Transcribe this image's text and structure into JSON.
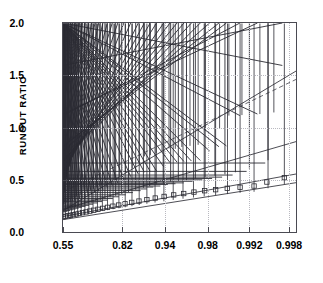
{
  "chart_data": {
    "type": "scatter",
    "title": "",
    "xlabel": "",
    "ylabel": "RUNOUT RATIO",
    "grid": true,
    "legend": "none",
    "ylim": [
      0.0,
      2.0
    ],
    "yticks": [
      "0.0",
      "0.5",
      "1.0",
      "1.5",
      "2.0"
    ],
    "ytick_values": [
      0.0,
      0.5,
      1.0,
      1.5,
      2.0
    ],
    "xticks": [
      "0.55",
      "0.82",
      "0.94",
      "0.98",
      "0.992",
      "0.998"
    ],
    "xtick_values": [
      0.55,
      0.82,
      0.94,
      0.98,
      0.992,
      0.998
    ],
    "xtick_positions": [
      0.0,
      0.2553,
      0.438,
      0.621,
      0.8,
      0.9702
    ],
    "xlim_positions": [
      0.0,
      1.0
    ],
    "axis_note": "x axis uses a non-linear probability scale",
    "series": [
      {
        "name": "diamond-series",
        "marker": "diamond",
        "color": "#2b2b33",
        "points": [
          [
            0.0,
            0.255
          ],
          [
            0.006,
            0.262
          ],
          [
            0.012,
            0.268
          ],
          [
            0.018,
            0.275
          ],
          [
            0.024,
            0.281
          ],
          [
            0.03,
            0.289
          ],
          [
            0.037,
            0.296
          ],
          [
            0.044,
            0.303
          ],
          [
            0.051,
            0.311
          ],
          [
            0.058,
            0.318
          ],
          [
            0.066,
            0.326
          ],
          [
            0.074,
            0.334
          ],
          [
            0.082,
            0.342
          ],
          [
            0.091,
            0.351
          ],
          [
            0.1,
            0.36
          ],
          [
            0.11,
            0.369
          ],
          [
            0.12,
            0.379
          ],
          [
            0.131,
            0.39
          ],
          [
            0.143,
            0.402
          ],
          [
            0.156,
            0.415
          ],
          [
            0.17,
            0.43
          ],
          [
            0.185,
            0.446
          ],
          [
            0.202,
            0.465
          ],
          [
            0.221,
            0.487
          ],
          [
            0.243,
            0.513
          ],
          [
            0.268,
            0.545
          ],
          [
            0.297,
            0.585
          ],
          [
            0.327,
            0.64
          ],
          [
            0.35,
            0.7
          ],
          [
            0.375,
            0.712
          ],
          [
            0.4,
            0.73
          ],
          [
            0.425,
            0.745
          ],
          [
            0.455,
            0.775
          ],
          [
            0.482,
            0.772
          ],
          [
            0.51,
            0.79
          ],
          [
            0.545,
            0.8
          ],
          [
            0.58,
            0.81
          ],
          [
            0.61,
            0.945
          ],
          [
            0.672,
            0.965
          ],
          [
            0.712,
            1.09
          ],
          [
            0.768,
            1.095
          ],
          [
            0.845,
            1.105
          ],
          [
            0.905,
            1.12
          ]
        ]
      },
      {
        "name": "cross-series",
        "marker": "cross",
        "color": "#2b2b33",
        "points": [
          [
            0.0,
            0.232
          ],
          [
            0.008,
            0.238
          ],
          [
            0.016,
            0.244
          ],
          [
            0.024,
            0.25
          ],
          [
            0.033,
            0.257
          ],
          [
            0.042,
            0.264
          ],
          [
            0.051,
            0.271
          ],
          [
            0.061,
            0.278
          ],
          [
            0.071,
            0.286
          ],
          [
            0.082,
            0.294
          ],
          [
            0.094,
            0.303
          ],
          [
            0.106,
            0.313
          ],
          [
            0.119,
            0.324
          ],
          [
            0.133,
            0.336
          ],
          [
            0.148,
            0.349
          ],
          [
            0.164,
            0.363
          ],
          [
            0.182,
            0.38
          ],
          [
            0.201,
            0.399
          ],
          [
            0.222,
            0.42
          ],
          [
            0.246,
            0.445
          ],
          [
            0.272,
            0.474
          ],
          [
            0.301,
            0.507
          ],
          [
            0.334,
            0.53
          ],
          [
            0.36,
            0.548
          ],
          [
            0.385,
            0.556
          ],
          [
            0.412,
            0.56
          ],
          [
            0.443,
            0.6
          ],
          [
            0.47,
            0.64
          ],
          [
            0.5,
            0.645
          ],
          [
            0.53,
            0.65
          ],
          [
            0.562,
            0.655
          ],
          [
            0.6,
            0.66
          ],
          [
            0.64,
            0.752
          ],
          [
            0.68,
            0.792
          ],
          [
            0.712,
            0.8
          ],
          [
            0.77,
            1.09
          ],
          [
            0.845,
            1.105
          ],
          [
            0.952,
            1.57
          ]
        ]
      },
      {
        "name": "plus-series",
        "marker": "plus",
        "color": "#2b2b33",
        "points": [
          [
            0.0,
            0.18
          ],
          [
            0.01,
            0.186
          ],
          [
            0.02,
            0.192
          ],
          [
            0.031,
            0.198
          ],
          [
            0.042,
            0.205
          ],
          [
            0.054,
            0.212
          ],
          [
            0.066,
            0.219
          ],
          [
            0.079,
            0.227
          ],
          [
            0.093,
            0.236
          ],
          [
            0.108,
            0.245
          ],
          [
            0.124,
            0.255
          ],
          [
            0.141,
            0.266
          ],
          [
            0.16,
            0.278
          ],
          [
            0.18,
            0.291
          ],
          [
            0.202,
            0.305
          ],
          [
            0.226,
            0.32
          ],
          [
            0.252,
            0.337
          ],
          [
            0.281,
            0.356
          ],
          [
            0.312,
            0.377
          ],
          [
            0.345,
            0.396
          ],
          [
            0.372,
            0.412
          ],
          [
            0.4,
            0.43
          ],
          [
            0.43,
            0.44
          ],
          [
            0.462,
            0.455
          ],
          [
            0.495,
            0.462
          ],
          [
            0.53,
            0.47
          ],
          [
            0.568,
            0.485
          ],
          [
            0.61,
            0.5
          ],
          [
            0.652,
            0.512
          ],
          [
            0.695,
            0.525
          ],
          [
            0.74,
            0.545
          ],
          [
            0.8,
            0.58
          ],
          [
            0.88,
            0.66
          ]
        ]
      },
      {
        "name": "square-series",
        "marker": "square",
        "color": "#2b2b33",
        "points": [
          [
            0.0,
            0.145
          ],
          [
            0.01,
            0.15
          ],
          [
            0.021,
            0.155
          ],
          [
            0.032,
            0.16
          ],
          [
            0.044,
            0.166
          ],
          [
            0.057,
            0.172
          ],
          [
            0.07,
            0.178
          ],
          [
            0.084,
            0.185
          ],
          [
            0.099,
            0.192
          ],
          [
            0.115,
            0.2
          ],
          [
            0.132,
            0.208
          ],
          [
            0.15,
            0.217
          ],
          [
            0.17,
            0.226
          ],
          [
            0.191,
            0.236
          ],
          [
            0.214,
            0.247
          ],
          [
            0.239,
            0.258
          ],
          [
            0.266,
            0.27
          ],
          [
            0.295,
            0.283
          ],
          [
            0.326,
            0.296
          ],
          [
            0.36,
            0.31
          ],
          [
            0.396,
            0.325
          ],
          [
            0.434,
            0.34
          ],
          [
            0.475,
            0.355
          ],
          [
            0.518,
            0.368
          ],
          [
            0.562,
            0.382
          ],
          [
            0.608,
            0.395
          ],
          [
            0.655,
            0.405
          ],
          [
            0.705,
            0.418
          ],
          [
            0.76,
            0.428
          ],
          [
            0.82,
            0.44
          ],
          [
            0.875,
            0.478
          ],
          [
            0.95,
            0.52
          ]
        ]
      },
      {
        "name": "triangle-series",
        "marker": "triangle",
        "color": "#2b2b33",
        "points": [
          [
            0.0,
            0.11
          ],
          [
            0.011,
            0.114
          ],
          [
            0.023,
            0.118
          ],
          [
            0.036,
            0.123
          ],
          [
            0.049,
            0.128
          ],
          [
            0.063,
            0.133
          ],
          [
            0.078,
            0.139
          ],
          [
            0.094,
            0.145
          ],
          [
            0.111,
            0.152
          ],
          [
            0.129,
            0.159
          ],
          [
            0.148,
            0.166
          ],
          [
            0.169,
            0.174
          ],
          [
            0.191,
            0.182
          ],
          [
            0.215,
            0.191
          ],
          [
            0.24,
            0.2
          ],
          [
            0.267,
            0.21
          ],
          [
            0.296,
            0.22
          ],
          [
            0.327,
            0.231
          ],
          [
            0.36,
            0.243
          ],
          [
            0.395,
            0.255
          ],
          [
            0.433,
            0.267
          ],
          [
            0.473,
            0.28
          ],
          [
            0.515,
            0.292
          ],
          [
            0.56,
            0.303
          ],
          [
            0.606,
            0.314
          ],
          [
            0.655,
            0.325
          ],
          [
            0.706,
            0.336
          ],
          [
            0.76,
            0.348
          ],
          [
            0.82,
            0.358
          ],
          [
            0.88,
            0.392
          ],
          [
            0.95,
            0.432
          ]
        ]
      }
    ],
    "fit_lines": [
      {
        "name": "diamond-cross-fit",
        "style": "solid",
        "color": "#3a3a42",
        "x0": 0.0,
        "y0": 0.205,
        "x1": 1.0,
        "y1": 1.54
      },
      {
        "name": "dashed-fit",
        "style": "dashed",
        "color": "#5a5a62",
        "x0": 0.0,
        "y0": 0.385,
        "x1": 1.0,
        "y1": 1.46
      },
      {
        "name": "plus-fit",
        "style": "solid",
        "color": "#3a3a42",
        "x0": 0.0,
        "y0": 0.218,
        "x1": 1.0,
        "y1": 0.865
      },
      {
        "name": "square-fit",
        "style": "solid",
        "color": "#3a3a42",
        "x0": 0.0,
        "y0": 0.148,
        "x1": 1.0,
        "y1": 0.555
      },
      {
        "name": "triangle-fit",
        "style": "solid",
        "color": "#3a3a42",
        "x0": 0.0,
        "y0": 0.118,
        "x1": 1.0,
        "y1": 0.472
      }
    ]
  }
}
